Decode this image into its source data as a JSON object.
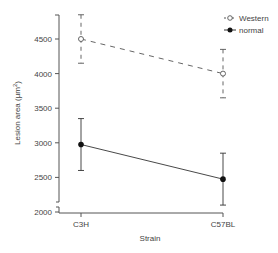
{
  "chart_data": {
    "type": "line",
    "title": "",
    "xlabel": "Strain",
    "ylabel": "Lesion area (µm²)",
    "ylabel_main": "Lesion area (µm",
    "ylabel_sup": "2",
    "ylabel_close": ")",
    "categories": [
      "C3H",
      "C57BL"
    ],
    "ylim": [
      2000,
      4850
    ],
    "yticks": [
      2000,
      2500,
      3000,
      3500,
      4000,
      4500
    ],
    "ytick_labels": [
      "2000",
      "2500",
      "3000",
      "3500",
      "4000",
      "4500"
    ],
    "axis_break": true,
    "grid": false,
    "legend_position": "top-right",
    "series": [
      {
        "name": "Western",
        "values": [
          4500,
          4000
        ],
        "error_low": [
          4150,
          3650
        ],
        "error_high": [
          4850,
          4350
        ],
        "marker": "open-circle",
        "line_style": "dashed",
        "color": "#555555"
      },
      {
        "name": "normal",
        "values": [
          2975,
          2475
        ],
        "error_low": [
          2600,
          2100
        ],
        "error_high": [
          3350,
          2850
        ],
        "marker": "filled-circle",
        "line_style": "solid",
        "color": "#333333"
      }
    ]
  },
  "legend": {
    "items": [
      {
        "label": "Western"
      },
      {
        "label": "normal"
      }
    ]
  },
  "colors": {
    "axis": "#555555",
    "text": "#444444",
    "background": "#ffffff"
  }
}
